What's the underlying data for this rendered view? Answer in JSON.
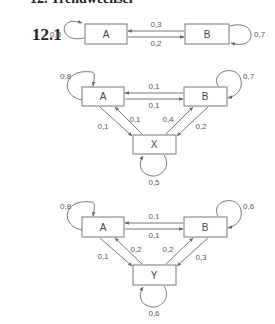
{
  "heading": "12.  Trendwechsel",
  "subsection": "12.1",
  "diagrams": [
    {
      "nodes": [
        "A",
        "B"
      ],
      "self_loops": {
        "A": "0,8",
        "B": "0,7"
      },
      "edges": [
        {
          "from": "B",
          "to": "A",
          "label": "0,3"
        },
        {
          "from": "A",
          "to": "B",
          "label": "0,2"
        }
      ]
    },
    {
      "nodes": [
        "A",
        "B",
        "X"
      ],
      "self_loops": {
        "A": "0,8",
        "B": "0,7",
        "X": "0,5"
      },
      "edges": [
        {
          "from": "B",
          "to": "A",
          "label": "0,1"
        },
        {
          "from": "A",
          "to": "B",
          "label": "0,1"
        },
        {
          "from": "A",
          "to": "X",
          "label": "0,1"
        },
        {
          "from": "X",
          "to": "A",
          "label": "0,1"
        },
        {
          "from": "X",
          "to": "B",
          "label": "0,4"
        },
        {
          "from": "B",
          "to": "X",
          "label": "0,2"
        }
      ]
    },
    {
      "nodes": [
        "A",
        "B",
        "Y"
      ],
      "self_loops": {
        "A": "0,8",
        "B": "0,6",
        "Y": "0,6"
      },
      "edges": [
        {
          "from": "B",
          "to": "A",
          "label": "0,1"
        },
        {
          "from": "A",
          "to": "B",
          "label": "0,1"
        },
        {
          "from": "A",
          "to": "Y",
          "label": "0,1"
        },
        {
          "from": "Y",
          "to": "A",
          "label": "0,2"
        },
        {
          "from": "Y",
          "to": "B",
          "label": "0,2"
        },
        {
          "from": "B",
          "to": "Y",
          "label": "0,3"
        }
      ]
    }
  ]
}
